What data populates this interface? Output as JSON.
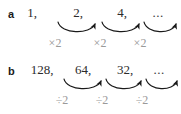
{
  "figure": {
    "background_color": "#ffffff",
    "term_color": "#2b2b2b",
    "operator_color": "#9a9a9a",
    "arrow_color": "#1a1a1a"
  },
  "parts": [
    {
      "label": "a",
      "terms": [
        "1,",
        "2,",
        "4,",
        "..."
      ],
      "term_positions": [
        10,
        56,
        100,
        136
      ],
      "operators": [
        "×2",
        "×2",
        "×2"
      ],
      "operator_positions": [
        33,
        78,
        118
      ],
      "arcs": [
        {
          "x1": 36,
          "y1": 2,
          "x2": 74,
          "y2": 2
        },
        {
          "x1": 80,
          "y1": 2,
          "x2": 118,
          "y2": 2
        },
        {
          "x1": 122,
          "y1": 2,
          "x2": 158,
          "y2": 2
        }
      ]
    },
    {
      "label": "b",
      "terms": [
        "128,",
        "64,",
        "32,",
        "..."
      ],
      "term_positions": [
        20,
        61,
        103,
        137
      ],
      "operators": [
        "÷2",
        "÷2",
        "÷2"
      ],
      "operator_positions": [
        40,
        80,
        120
      ],
      "arcs": [
        {
          "x1": 44,
          "y1": 2,
          "x2": 80,
          "y2": 2
        },
        {
          "x1": 84,
          "y1": 2,
          "x2": 120,
          "y2": 2
        },
        {
          "x1": 124,
          "y1": 2,
          "x2": 159,
          "y2": 2
        }
      ]
    }
  ]
}
